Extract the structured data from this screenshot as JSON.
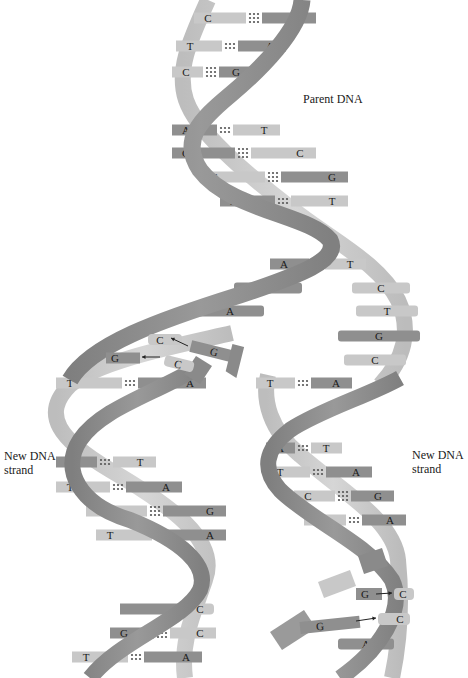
{
  "labels": {
    "parent": "Parent DNA",
    "new_left_line1": "New DNA",
    "new_left_line2": "strand",
    "new_right_line1": "New DNA",
    "new_right_line2": "strand"
  },
  "colors": {
    "background": "#ffffff",
    "backbone_dark": "#8a8a8a",
    "backbone_light": "#c4c4c4",
    "base_purine": "#8f8f8f",
    "base_pyrimidine": "#c8c8c8",
    "dots": "#555555",
    "text": "#1a1a1a"
  },
  "parent_pairs": [
    {
      "left": "C",
      "right": "G",
      "y": 18,
      "x1": 208,
      "x2": 300,
      "bonds": 3
    },
    {
      "left": "T",
      "right": "A",
      "y": 46,
      "x1": 190,
      "x2": 270,
      "bonds": 2
    },
    {
      "left": "C",
      "right": "G",
      "y": 72,
      "x1": 186,
      "x2": 236,
      "bonds": 3
    },
    {
      "left": "A",
      "right": "T",
      "y": 130,
      "x1": 186,
      "x2": 264,
      "bonds": 2
    },
    {
      "left": "G",
      "right": "C",
      "y": 153,
      "x1": 186,
      "x2": 300,
      "bonds": 3
    },
    {
      "left": "C",
      "right": "G",
      "y": 177,
      "x1": 214,
      "x2": 332,
      "bonds": 3
    },
    {
      "left": "A",
      "right": "T",
      "y": 201,
      "x1": 234,
      "x2": 332,
      "bonds": 2
    },
    {
      "left": "A",
      "right": "T",
      "y": 264,
      "x1": 284,
      "x2": 350,
      "bonds": 2
    }
  ],
  "unpaired_left": [
    {
      "base": "G",
      "y": 288,
      "x1": 248,
      "x2": 288
    },
    {
      "base": "A",
      "y": 311,
      "x1": 210,
      "x2": 250
    }
  ],
  "unpaired_right": [
    {
      "base": "C",
      "y": 288,
      "x1": 366,
      "x2": 396
    },
    {
      "base": "T",
      "y": 311,
      "x1": 370,
      "x2": 404
    },
    {
      "base": "G",
      "y": 336,
      "x1": 352,
      "x2": 406
    },
    {
      "base": "C",
      "y": 360,
      "x1": 358,
      "x2": 392
    }
  ],
  "incoming": {
    "left": [
      {
        "template": "C",
        "incoming": "G",
        "y": 340
      },
      {
        "template": "G",
        "incoming": "C",
        "y": 358
      }
    ],
    "right": [
      {
        "template": "C",
        "incoming": "G",
        "y": 594
      },
      {
        "template": "C",
        "incoming": "G",
        "y": 620
      }
    ]
  },
  "left_daughter_pairs": [
    {
      "left": "T",
      "right": "A",
      "y": 383,
      "x1": 70,
      "x2": 190,
      "bonds": 2
    },
    {
      "left": "A",
      "right": "T",
      "y": 462,
      "x1": 70,
      "x2": 140,
      "bonds": 2
    },
    {
      "left": "T",
      "right": "A",
      "y": 487,
      "x1": 70,
      "x2": 166,
      "bonds": 2
    },
    {
      "left": "C",
      "right": "G",
      "y": 511,
      "x1": 100,
      "x2": 210,
      "bonds": 3
    },
    {
      "left": "T",
      "right": "A",
      "y": 535,
      "x1": 110,
      "x2": 210,
      "bonds": 2
    },
    {
      "left": "G",
      "right": "C",
      "y": 633,
      "x1": 124,
      "x2": 200,
      "bonds": 3
    },
    {
      "left": "T",
      "right": "A",
      "y": 657,
      "x1": 86,
      "x2": 186,
      "bonds": 2
    }
  ],
  "left_daughter_partial": {
    "right": "C",
    "y": 609,
    "x": 200,
    "bonds": 3
  },
  "right_daughter_pairs": [
    {
      "left": "T",
      "right": "A",
      "y": 383,
      "x1": 270,
      "x2": 336,
      "bonds": 2
    },
    {
      "left": "A",
      "right": "T",
      "y": 448,
      "x1": 280,
      "x2": 326,
      "bonds": 2
    },
    {
      "left": "T",
      "right": "A",
      "y": 472,
      "x1": 280,
      "x2": 356,
      "bonds": 2
    },
    {
      "left": "C",
      "right": "G",
      "y": 496,
      "x1": 308,
      "x2": 378,
      "bonds": 3
    },
    {
      "left": "T",
      "right": "A",
      "y": 520,
      "x1": 318,
      "x2": 390,
      "bonds": 2
    }
  ],
  "right_bottom": {
    "base": "A",
    "y": 644,
    "x": 368
  }
}
